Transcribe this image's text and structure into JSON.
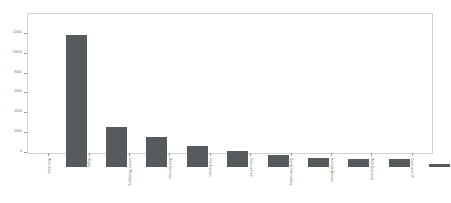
{
  "chart_data": {
    "type": "bar",
    "title": "",
    "subtitle": "",
    "xlabel": "",
    "ylabel": "",
    "grid": false,
    "legend": "none",
    "orientation": "vertical",
    "bar_color": "#555a5d",
    "plot_border_color": "#d2d2d2",
    "background_color": "#ffffff",
    "axis_label_rotation_degrees": 90,
    "ylim": [
      0,
      14000
    ],
    "yticks": [
      0,
      2000,
      4000,
      6000,
      8000,
      10000,
      12000
    ],
    "ytick_labels": [
      "0",
      "2000",
      "4000",
      "6000",
      "8000",
      "10000",
      "12000"
    ],
    "categories": [
      "Web Sites",
      "Skype",
      "Instant Messaging",
      "Web Services",
      "File Transfer",
      "Peer-to-Peer",
      "Social Networking",
      "Remote Access",
      "Web Browsing",
      "Voice over IP"
    ],
    "values": [
      13250,
      4040,
      3060,
      2110,
      1640,
      1180,
      880,
      810,
      800,
      280
    ]
  }
}
